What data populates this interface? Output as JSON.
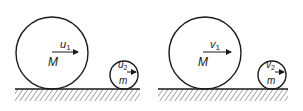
{
  "diagram": {
    "panels": [
      {
        "name": "before-collision",
        "large_ball": {
          "mass_label": "M",
          "velocity_label": "u",
          "velocity_subscript": "1"
        },
        "small_ball": {
          "mass_label": "m",
          "velocity_label": "u",
          "velocity_subscript": "2"
        }
      },
      {
        "name": "after-collision",
        "large_ball": {
          "mass_label": "M",
          "velocity_label": "v",
          "velocity_subscript": "1"
        },
        "small_ball": {
          "mass_label": "m",
          "velocity_label": "v",
          "velocity_subscript": "2"
        }
      }
    ],
    "colors": {
      "stroke": "#1a1a1a",
      "background": "#ffffff"
    }
  }
}
